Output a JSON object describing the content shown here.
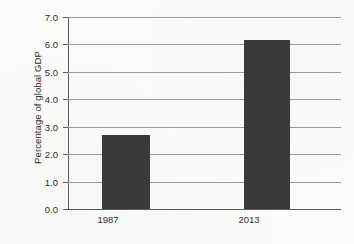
{
  "chart_data": {
    "type": "bar",
    "title": "",
    "subtitle": "",
    "xlabel": "",
    "ylabel": "Percentage of global GDP",
    "categories": [
      "1987",
      "2013"
    ],
    "values": [
      2.7,
      6.15
    ],
    "series": [
      {
        "name": "Percentage of global GDP",
        "values": [
          2.7,
          6.15
        ]
      }
    ],
    "ylim": [
      0.0,
      7.0
    ],
    "ytick_labels": [
      "7.0",
      "6.0",
      "5.0",
      "4.0",
      "3.0",
      "2.0",
      "1.0",
      "0.0"
    ],
    "ytick_values": [
      7.0,
      6.0,
      5.0,
      4.0,
      3.0,
      2.0,
      1.0,
      0.0
    ],
    "grid": true,
    "grid_axis": "y",
    "legend": false,
    "legend_position": "none",
    "bar_color": "#3a3a3a",
    "gridline_color": "#9a9a9a",
    "axis_color": "#5d5d5d",
    "background_color": "#fbfbfa",
    "text_color": "#2b2b2b",
    "annotations": []
  }
}
